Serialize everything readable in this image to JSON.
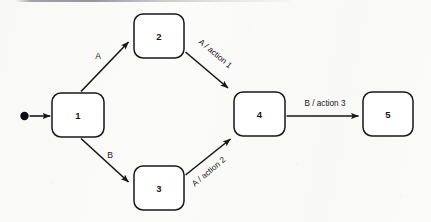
{
  "diagram": {
    "type": "state-transition-diagram",
    "title": "",
    "background_color": "#fbfbfa",
    "stroke_color": "#17171a",
    "fill_color": "#ffffff",
    "canvas": {
      "width": 431,
      "height": 222
    },
    "initial_marker": {
      "name": "initial-state-dot",
      "cx": 24.5,
      "cy": 116,
      "r": 4.2,
      "target_state": "1"
    },
    "states": [
      {
        "id": "s1",
        "label": "1",
        "x": 52,
        "y": 93,
        "w": 52,
        "h": 44,
        "rx": 9
      },
      {
        "id": "s2",
        "label": "2",
        "x": 134,
        "y": 14,
        "w": 50,
        "h": 44,
        "rx": 9
      },
      {
        "id": "s3",
        "label": "3",
        "x": 134,
        "y": 166,
        "w": 50,
        "h": 44,
        "rx": 9
      },
      {
        "id": "s4",
        "label": "4",
        "x": 234,
        "y": 92,
        "w": 51,
        "h": 44,
        "rx": 9
      },
      {
        "id": "s5",
        "label": "5",
        "x": 363,
        "y": 92,
        "w": 50,
        "h": 44,
        "rx": 9
      }
    ],
    "transitions": [
      {
        "id": "t0",
        "from": "initial",
        "to": "1",
        "label": "",
        "label_rotation": 0,
        "label_x": 0,
        "label_y": 0,
        "path": "M 29.6 116 L 50.2 116"
      },
      {
        "id": "t1",
        "from": "1",
        "to": "2",
        "label": "A",
        "label_rotation": 0,
        "label_x": 98,
        "label_y": 57,
        "path": "M 81 91.5 L 128.5 42"
      },
      {
        "id": "t2",
        "from": "1",
        "to": "3",
        "label": "B",
        "label_rotation": 0,
        "label_x": 110,
        "label_y": 156,
        "path": "M 81 138.5 L 128.5 182"
      },
      {
        "id": "t3",
        "from": "2",
        "to": "4",
        "label": "A / action 1",
        "label_rotation": 40,
        "label_x": 215,
        "label_y": 54,
        "path": "M 185.5 52 L 228 88"
      },
      {
        "id": "t4",
        "from": "3",
        "to": "4",
        "label": "A / action 2",
        "label_rotation": -40,
        "label_x": 209,
        "label_y": 172,
        "path": "M 185.5 175 L 230.5 139"
      },
      {
        "id": "t5",
        "from": "4",
        "to": "5",
        "label": "B / action 3",
        "label_rotation": 0,
        "label_x": 325,
        "label_y": 104,
        "path": "M 286.5 116 L 358.5 116"
      }
    ]
  }
}
